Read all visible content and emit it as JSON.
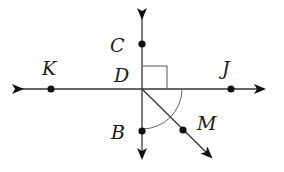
{
  "diagram": {
    "type": "geometry",
    "colors": {
      "line": "#333333",
      "arc": "#666666",
      "point": "#111111",
      "label": "#1a1a1a"
    },
    "intersection": {
      "label": "D"
    },
    "points": [
      {
        "label": "C",
        "position": "above D on vertical line"
      },
      {
        "label": "B",
        "position": "below D on vertical line"
      },
      {
        "label": "K",
        "position": "left of D on horizontal line"
      },
      {
        "label": "J",
        "position": "right of D on horizontal line"
      },
      {
        "label": "M",
        "position": "on ray from D toward lower right"
      }
    ],
    "lines": [
      {
        "name": "line KJ",
        "type": "line",
        "arrows": "both ends"
      },
      {
        "name": "line CB",
        "type": "line",
        "arrows": "both ends"
      },
      {
        "name": "ray DM",
        "type": "ray",
        "arrows": "one end"
      }
    ],
    "marks": [
      {
        "type": "right-angle",
        "angle": "CDJ"
      },
      {
        "type": "arc",
        "angle": "BDJ"
      }
    ]
  },
  "labels": {
    "C": "C",
    "D": "D",
    "K": "K",
    "J": "J",
    "B": "B",
    "M": "M"
  }
}
